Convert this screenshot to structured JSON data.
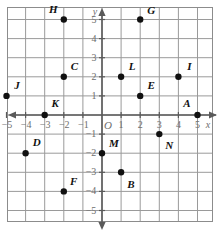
{
  "figure": {
    "kind": "coordinate-plane",
    "origin_label": "O",
    "x_axis_label": "x",
    "y_axis_label": "y"
  },
  "colors": {
    "grid": "#9a9a9a",
    "frame": "#8c8c8c",
    "axis": "#5a5a5a",
    "point": "#111111",
    "tick_text": "#6e6e6e",
    "label_text": "#111111",
    "background": "#ffffff"
  },
  "chart_data": {
    "type": "scatter",
    "title": "",
    "xlabel": "x",
    "ylabel": "y",
    "xlim": [
      -5.6,
      5.8
    ],
    "ylim": [
      -5.6,
      5.6
    ],
    "grid": true,
    "legend": "none",
    "x_ticks": [
      -5,
      -4,
      -3,
      -2,
      -1,
      1,
      2,
      3,
      4,
      5
    ],
    "y_ticks": [
      -5,
      -4,
      -3,
      -2,
      -1,
      1,
      2,
      3,
      4,
      5
    ],
    "x_tick_labels": [
      "−5",
      "−4",
      "−3",
      "−2",
      "−1",
      "1",
      "2",
      "3",
      "4",
      "5"
    ],
    "y_tick_labels": [
      "−5",
      "−4",
      "−3",
      "−2",
      "−1",
      "1",
      "2",
      "3",
      "4",
      "5"
    ],
    "points": [
      {
        "name": "A",
        "x": 5,
        "y": 0,
        "label_dx": -0.55,
        "label_dy": 0.62
      },
      {
        "name": "B",
        "x": 1,
        "y": -3,
        "label_dx": 0.52,
        "label_dy": -0.62
      },
      {
        "name": "C",
        "x": -2,
        "y": 2,
        "label_dx": 0.55,
        "label_dy": 0.55
      },
      {
        "name": "D",
        "x": -4,
        "y": -2,
        "label_dx": 0.58,
        "label_dy": 0.58
      },
      {
        "name": "E",
        "x": 2,
        "y": 1,
        "label_dx": 0.58,
        "label_dy": 0.58
      },
      {
        "name": "F",
        "x": -2,
        "y": -4,
        "label_dx": 0.52,
        "label_dy": 0.55
      },
      {
        "name": "G",
        "x": 2,
        "y": 5,
        "label_dx": 0.58,
        "label_dy": 0.52
      },
      {
        "name": "H",
        "x": -2,
        "y": 5,
        "label_dx": -0.55,
        "label_dy": 0.55
      },
      {
        "name": "I",
        "x": 4,
        "y": 2,
        "label_dx": 0.58,
        "label_dy": 0.58
      },
      {
        "name": "J",
        "x": -5,
        "y": 1,
        "label_dx": 0.55,
        "label_dy": 0.58
      },
      {
        "name": "K",
        "x": -3,
        "y": 0,
        "label_dx": 0.55,
        "label_dy": 0.62
      },
      {
        "name": "L",
        "x": 1,
        "y": 2,
        "label_dx": 0.58,
        "label_dy": 0.55
      },
      {
        "name": "M",
        "x": 0,
        "y": -2,
        "label_dx": 0.62,
        "label_dy": 0.52
      },
      {
        "name": "N",
        "x": 3,
        "y": -1,
        "label_dx": 0.52,
        "label_dy": -0.58
      }
    ]
  }
}
